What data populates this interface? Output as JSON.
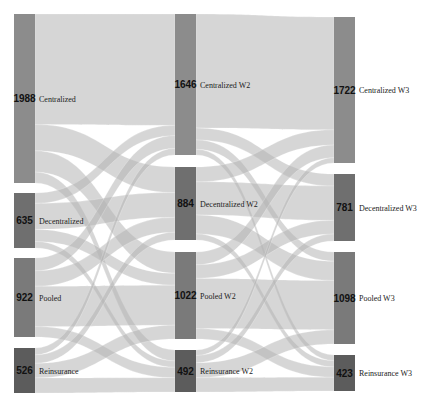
{
  "chart_data": {
    "type": "sankey",
    "title": "",
    "columns": [
      {
        "name": "Wave 1",
        "nodes": [
          {
            "id": "C1",
            "label": "Centralized",
            "value": 1988,
            "color": "#8c8c8c"
          },
          {
            "id": "D1",
            "label": "Decentralized",
            "value": 635,
            "color": "#6f6f6f"
          },
          {
            "id": "P1",
            "label": "Pooled",
            "value": 922,
            "color": "#7a7a7a"
          },
          {
            "id": "R1",
            "label": "Reinsurance",
            "value": 526,
            "color": "#5c5c5c"
          }
        ]
      },
      {
        "name": "Wave 2",
        "nodes": [
          {
            "id": "C2",
            "label": "Centralized W2",
            "value": 1646,
            "color": "#8c8c8c"
          },
          {
            "id": "D2",
            "label": "Decentralized W2",
            "value": 884,
            "color": "#6f6f6f"
          },
          {
            "id": "P2",
            "label": "Pooled W2",
            "value": 1022,
            "color": "#7a7a7a"
          },
          {
            "id": "R2",
            "label": "Reinsurance W2",
            "value": 492,
            "color": "#5c5c5c"
          }
        ]
      },
      {
        "name": "Wave 3",
        "nodes": [
          {
            "id": "C3",
            "label": "Centralized W3",
            "value": 1722,
            "color": "#8c8c8c"
          },
          {
            "id": "D3",
            "label": "Decentralized W3",
            "value": 781,
            "color": "#6f6f6f"
          },
          {
            "id": "P3",
            "label": "Pooled W3",
            "value": 1098,
            "color": "#7a7a7a"
          },
          {
            "id": "R3",
            "label": "Reinsurance W3",
            "value": 423,
            "color": "#5c5c5c"
          }
        ]
      }
    ],
    "links": [
      {
        "source": "C1",
        "target": "C2",
        "value": 1300
      },
      {
        "source": "C1",
        "target": "D2",
        "value": 310
      },
      {
        "source": "C1",
        "target": "P2",
        "value": 250
      },
      {
        "source": "C1",
        "target": "R2",
        "value": 128
      },
      {
        "source": "D1",
        "target": "C2",
        "value": 120
      },
      {
        "source": "D1",
        "target": "D2",
        "value": 300
      },
      {
        "source": "D1",
        "target": "P2",
        "value": 140
      },
      {
        "source": "D1",
        "target": "R2",
        "value": 75
      },
      {
        "source": "P1",
        "target": "C2",
        "value": 150
      },
      {
        "source": "P1",
        "target": "D2",
        "value": 180
      },
      {
        "source": "P1",
        "target": "P2",
        "value": 470
      },
      {
        "source": "P1",
        "target": "R2",
        "value": 122
      },
      {
        "source": "R1",
        "target": "C2",
        "value": 76
      },
      {
        "source": "R1",
        "target": "D2",
        "value": 94
      },
      {
        "source": "R1",
        "target": "P2",
        "value": 162
      },
      {
        "source": "R1",
        "target": "R2",
        "value": 167
      },
      {
        "source": "C2",
        "target": "C3",
        "value": 1330
      },
      {
        "source": "C2",
        "target": "D3",
        "value": 140
      },
      {
        "source": "C2",
        "target": "P3",
        "value": 110
      },
      {
        "source": "C2",
        "target": "R3",
        "value": 66
      },
      {
        "source": "D2",
        "target": "C3",
        "value": 180
      },
      {
        "source": "D2",
        "target": "D3",
        "value": 400
      },
      {
        "source": "D2",
        "target": "P3",
        "value": 230
      },
      {
        "source": "D2",
        "target": "R3",
        "value": 74
      },
      {
        "source": "P2",
        "target": "C3",
        "value": 150
      },
      {
        "source": "P2",
        "target": "D3",
        "value": 160
      },
      {
        "source": "P2",
        "target": "P3",
        "value": 590
      },
      {
        "source": "P2",
        "target": "R3",
        "value": 122
      },
      {
        "source": "R2",
        "target": "C3",
        "value": 62
      },
      {
        "source": "R2",
        "target": "D3",
        "value": 81
      },
      {
        "source": "R2",
        "target": "P3",
        "value": 168
      },
      {
        "source": "R2",
        "target": "R3",
        "value": 161
      }
    ],
    "layout": {
      "node_x": [
        14,
        175,
        334
      ],
      "node_width": 21,
      "node_y": {
        "C1": [
          14,
          183
        ],
        "D1": [
          193,
          248
        ],
        "P1": [
          258,
          337
        ],
        "R1": [
          348,
          393
        ],
        "C2": [
          14,
          155
        ],
        "D2": [
          167,
          240
        ],
        "P2": [
          252,
          339
        ],
        "R2": [
          350,
          392
        ],
        "C3": [
          17,
          163
        ],
        "D3": [
          174,
          241
        ],
        "P3": [
          252,
          344
        ],
        "R3": [
          355,
          391
        ]
      },
      "link_color": "#b4b4b4",
      "link_opacity": 0.55
    }
  }
}
